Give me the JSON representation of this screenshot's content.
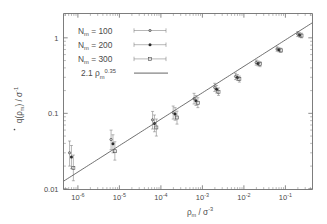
{
  "chart_data": {
    "type": "scatter",
    "title": "",
    "xlabel": "ρ_m / σ^-3",
    "ylabel": "q̇(ρ_m) / σ^-1",
    "xscale": "log",
    "yscale": "log",
    "xlim": [
      4.5e-07,
      0.45
    ],
    "ylim": [
      0.0098,
      2.1
    ],
    "grid": false,
    "legend_position": "upper-left-inside",
    "xticks": [
      {
        "value": 1e-06,
        "mantissa": "10",
        "exponent": "-6"
      },
      {
        "value": 1e-05,
        "mantissa": "10",
        "exponent": "-5"
      },
      {
        "value": 0.0001,
        "mantissa": "10",
        "exponent": "-4"
      },
      {
        "value": 0.001,
        "mantissa": "10",
        "exponent": "-3"
      },
      {
        "value": 0.01,
        "mantissa": "10",
        "exponent": "-2"
      },
      {
        "value": 0.1,
        "mantissa": "10",
        "exponent": "-1"
      }
    ],
    "yticks": [
      {
        "value": 1,
        "label": "1"
      },
      {
        "value": 0.1,
        "label": "0.1"
      },
      {
        "value": 0.01,
        "label": "0.01"
      }
    ],
    "fit": {
      "label": "2.1 ρ_m^0.35",
      "label_coefficient": "2.1",
      "label_base": "ρ",
      "label_base_sub": "m",
      "label_exponent": "0.35",
      "coefficient": 2.1,
      "exponent": 0.35,
      "color": "#555555"
    },
    "series": [
      {
        "name": "N_m = 100",
        "label_base": "N",
        "label_sub": "m",
        "label_value": "100",
        "marker": "dot-small",
        "color": "#4b4b4b",
        "points": [
          {
            "x": 7e-07,
            "y": 0.03,
            "yerr_low": 0.02,
            "yerr_high": 0.043
          },
          {
            "x": 7e-06,
            "y": 0.045,
            "yerr_low": 0.033,
            "yerr_high": 0.06
          },
          {
            "x": 7e-05,
            "y": 0.082,
            "yerr_low": 0.062,
            "yerr_high": 0.106
          },
          {
            "x": 0.00022,
            "y": 0.102,
            "yerr_low": 0.084,
            "yerr_high": 0.125
          },
          {
            "x": 0.0007,
            "y": 0.156,
            "yerr_low": 0.133,
            "yerr_high": 0.184
          },
          {
            "x": 0.0022,
            "y": 0.22,
            "yerr_low": 0.195,
            "yerr_high": 0.25
          },
          {
            "x": 0.007,
            "y": 0.308,
            "yerr_low": 0.28,
            "yerr_high": 0.34
          },
          {
            "x": 0.022,
            "y": 0.47,
            "yerr_low": 0.435,
            "yerr_high": 0.508
          },
          {
            "x": 0.07,
            "y": 0.71,
            "yerr_low": 0.665,
            "yerr_high": 0.76
          },
          {
            "x": 0.22,
            "y": 1.12,
            "yerr_low": 1.04,
            "yerr_high": 1.21
          }
        ]
      },
      {
        "name": "N_m = 200",
        "label_base": "N",
        "label_sub": "m",
        "label_value": "200",
        "marker": "dot-filled",
        "color": "#2b2b2b",
        "points": [
          {
            "x": 7e-07,
            "y": 0.0265,
            "yerr_low": 0.0185,
            "yerr_high": 0.0375
          },
          {
            "x": 7e-06,
            "y": 0.0395,
            "yerr_low": 0.03,
            "yerr_high": 0.052
          },
          {
            "x": 7e-05,
            "y": 0.0735,
            "yerr_low": 0.057,
            "yerr_high": 0.095
          },
          {
            "x": 0.00022,
            "y": 0.098,
            "yerr_low": 0.081,
            "yerr_high": 0.119
          },
          {
            "x": 0.0007,
            "y": 0.147,
            "yerr_low": 0.127,
            "yerr_high": 0.172
          },
          {
            "x": 0.0022,
            "y": 0.208,
            "yerr_low": 0.186,
            "yerr_high": 0.234
          },
          {
            "x": 0.007,
            "y": 0.298,
            "yerr_low": 0.272,
            "yerr_high": 0.326
          },
          {
            "x": 0.022,
            "y": 0.458,
            "yerr_low": 0.425,
            "yerr_high": 0.493
          },
          {
            "x": 0.07,
            "y": 0.695,
            "yerr_low": 0.652,
            "yerr_high": 0.74
          },
          {
            "x": 0.22,
            "y": 1.09,
            "yerr_low": 1.02,
            "yerr_high": 1.17
          }
        ]
      },
      {
        "name": "N_m = 300",
        "label_base": "N",
        "label_sub": "m",
        "label_value": "300",
        "marker": "square-open",
        "color": "#4b4b4b",
        "points": [
          {
            "x": 7e-07,
            "y": 0.0188,
            "yerr_low": 0.0128,
            "yerr_high": 0.028
          },
          {
            "x": 7e-06,
            "y": 0.0315,
            "yerr_low": 0.024,
            "yerr_high": 0.042
          },
          {
            "x": 7e-05,
            "y": 0.065,
            "yerr_low": 0.05,
            "yerr_high": 0.084
          },
          {
            "x": 0.00022,
            "y": 0.088,
            "yerr_low": 0.072,
            "yerr_high": 0.107
          },
          {
            "x": 0.0007,
            "y": 0.138,
            "yerr_low": 0.119,
            "yerr_high": 0.161
          },
          {
            "x": 0.0022,
            "y": 0.193,
            "yerr_low": 0.173,
            "yerr_high": 0.217
          },
          {
            "x": 0.007,
            "y": 0.284,
            "yerr_low": 0.259,
            "yerr_high": 0.311
          },
          {
            "x": 0.022,
            "y": 0.448,
            "yerr_low": 0.415,
            "yerr_high": 0.483
          },
          {
            "x": 0.07,
            "y": 0.682,
            "yerr_low": 0.64,
            "yerr_high": 0.727
          },
          {
            "x": 0.22,
            "y": 1.07,
            "yerr_low": 1.0,
            "yerr_high": 1.15
          }
        ]
      }
    ]
  },
  "axes": {
    "y_label_parts": {
      "q": "q",
      "dot": "̇",
      "open": "(",
      "rho": "ρ",
      "sub": "m",
      "close": ")",
      "slash": " / ",
      "sigma": "σ",
      "sup": "-1"
    },
    "x_label_parts": {
      "rho": "ρ",
      "sub": "m",
      "slash": " / ",
      "sigma": "σ",
      "sup": "-3"
    }
  }
}
